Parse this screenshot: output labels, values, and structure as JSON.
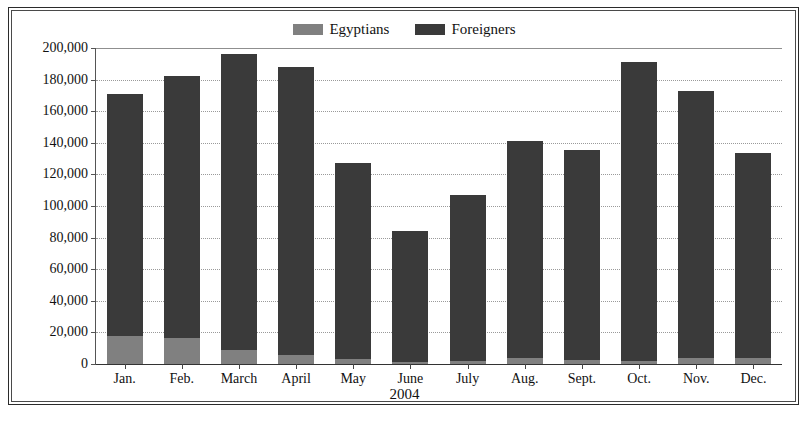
{
  "chart_data": {
    "type": "bar",
    "stacked": true,
    "title": "",
    "subtitle": "",
    "xlabel": "2004",
    "ylabel": "",
    "categories": [
      "Jan.",
      "Feb.",
      "March",
      "April",
      "May",
      "June",
      "July",
      "Aug.",
      "Sept.",
      "Oct.",
      "Nov.",
      "Dec."
    ],
    "series": [
      {
        "name": "Egyptians",
        "color": "#808080",
        "values": [
          17500,
          16500,
          9000,
          5500,
          3000,
          1500,
          2000,
          3500,
          2500,
          2000,
          3500,
          4000
        ]
      },
      {
        "name": "Foreigners",
        "color": "#3a3a3a",
        "values": [
          153500,
          165500,
          187000,
          182500,
          124000,
          82500,
          105000,
          137500,
          133000,
          189000,
          169500,
          129500
        ]
      }
    ],
    "totals": [
      171000,
      182000,
      196000,
      188000,
      127000,
      84000,
      107000,
      141000,
      135500,
      191000,
      173000,
      133500
    ],
    "ylim": [
      0,
      200000
    ],
    "ytick_step": 20000,
    "ytick_labels": [
      "0",
      "20,000",
      "40,000",
      "60,000",
      "80,000",
      "100,000",
      "120,000",
      "140,000",
      "160,000",
      "180,000",
      "200,000"
    ],
    "ytick_values": [
      0,
      20000,
      40000,
      60000,
      80000,
      100000,
      120000,
      140000,
      160000,
      180000,
      200000
    ],
    "grid": true,
    "legend_position": "top-center",
    "legend": [
      {
        "label": "Egyptians",
        "color": "#808080"
      },
      {
        "label": "Foreigners",
        "color": "#3a3a3a"
      }
    ]
  },
  "colors": {
    "egyptians": "#808080",
    "foreigners": "#3a3a3a",
    "grid": "#9a9a9a",
    "axis": "#333333",
    "frame": "#2b2b2b",
    "text": "#111111",
    "background": "#ffffff"
  }
}
